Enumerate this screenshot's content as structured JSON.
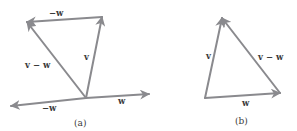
{
  "figure": {
    "panel_a": {
      "caption": "(a)",
      "vectors": [
        {
          "name": "w",
          "from": [
            86,
            98
          ],
          "to": [
            149,
            94
          ]
        },
        {
          "name": "-w",
          "from": [
            86,
            98
          ],
          "to": [
            11,
            106
          ]
        },
        {
          "name": "v",
          "from": [
            86,
            98
          ],
          "to": [
            102,
            17
          ]
        },
        {
          "name": "-w",
          "from": [
            102,
            17
          ],
          "to": [
            27,
            22
          ]
        },
        {
          "name": "v - w",
          "from": [
            86,
            98
          ],
          "to": [
            27,
            22
          ]
        }
      ],
      "labels": {
        "top_neg_w": "−w",
        "v": "v",
        "v_minus_w": "v − w",
        "bottom_neg_w": "−w",
        "w": "w"
      }
    },
    "panel_b": {
      "caption": "(b)",
      "vectors": [
        {
          "name": "w",
          "from": [
            205,
            98
          ],
          "to": [
            280,
            93
          ]
        },
        {
          "name": "v",
          "from": [
            205,
            98
          ],
          "to": [
            222,
            18
          ]
        },
        {
          "name": "v - w",
          "from": [
            280,
            93
          ],
          "to": [
            222,
            18
          ]
        }
      ],
      "labels": {
        "v": "v",
        "v_minus_w": "v − w",
        "w": "w"
      }
    },
    "colors": {
      "arrow": "#8a8a8e",
      "text": "#3a3a3a"
    }
  }
}
